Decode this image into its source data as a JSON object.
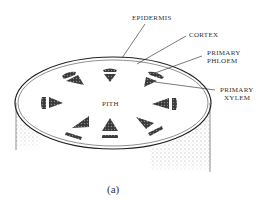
{
  "figure": {
    "caption": "(a)",
    "labels": {
      "epidermis": "EPIDERMIS",
      "cortex": "CORTEX",
      "primary_phloem_line1": "PRIMARY",
      "primary_phloem_line2": "PHLOEM",
      "primary_xylem_line1": "PRIMARY",
      "primary_xylem_line2": "XYLEM",
      "pith": "PITH"
    },
    "vascular_bundle_count": 8,
    "colors": {
      "ink": "#333333",
      "bundle_fill": "#444444",
      "background": "#ffffff"
    }
  }
}
